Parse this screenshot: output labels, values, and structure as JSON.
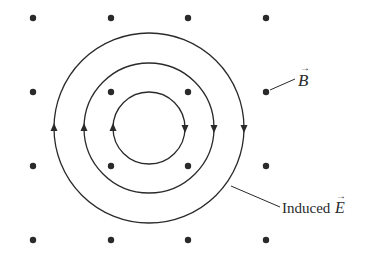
{
  "diagram": {
    "colors": {
      "ink": "#2a2a2a",
      "background": "#ffffff"
    },
    "field_dots": {
      "description": "Magnetic field B pointing out of the page",
      "xs": [
        33,
        111,
        188,
        266
      ],
      "ys": [
        18,
        92,
        166,
        240
      ],
      "radius": 3.2
    },
    "circles": [
      {
        "name": "outer",
        "cx": 149,
        "cy": 128,
        "r": 95
      },
      {
        "name": "middle",
        "cx": 149,
        "cy": 128,
        "r": 65
      },
      {
        "name": "inner",
        "cx": 149,
        "cy": 128,
        "r": 36
      }
    ],
    "circulation": "clockwise",
    "labels": {
      "b_field": {
        "symbol": "B",
        "vector_arrow": "→",
        "leader": {
          "x1": 270,
          "y1": 90,
          "x2": 295,
          "y2": 79
        }
      },
      "induced_e": {
        "prefix": "Induced ",
        "symbol": "E",
        "vector_arrow": "→",
        "leader": {
          "x1": 231,
          "y1": 186,
          "x2": 280,
          "y2": 207
        }
      }
    }
  }
}
